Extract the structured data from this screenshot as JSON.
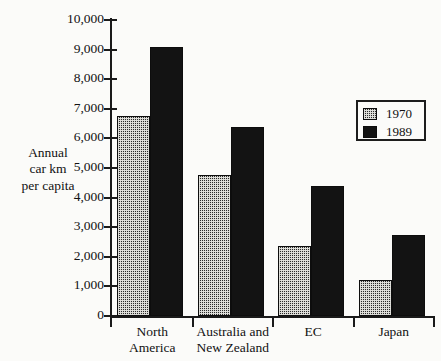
{
  "chart_data": {
    "type": "bar",
    "title": "",
    "xlabel": "",
    "ylabel": "Annual car km per capita",
    "ylabel_lines": [
      "Annual",
      "car km",
      "per capita"
    ],
    "categories": [
      "North America",
      "Australia and New Zealand",
      "EC",
      "Japan"
    ],
    "category_lines": [
      [
        "North",
        "America"
      ],
      [
        "Australia and",
        "New Zealand"
      ],
      [
        "EC"
      ],
      [
        "Japan"
      ]
    ],
    "series": [
      {
        "name": "1970",
        "values": [
          6750,
          4750,
          2350,
          1200
        ],
        "pattern": "hatch"
      },
      {
        "name": "1989",
        "values": [
          9100,
          6400,
          4400,
          2750
        ],
        "pattern": "solid"
      }
    ],
    "ylim": [
      0,
      10000
    ],
    "ytick_values": [
      10000,
      9000,
      8000,
      7000,
      6000,
      5000,
      4000,
      3000,
      2000,
      1000,
      0
    ],
    "ytick_labels": [
      "10,000",
      "9,000",
      "8,000",
      "7,000",
      "6,000",
      "5,000",
      "4,000",
      "3,000",
      "2,000",
      "1,000",
      "0"
    ],
    "grid": false,
    "legend_position": "upper right",
    "legend_entries": [
      "1970",
      "1989"
    ]
  },
  "colors": {
    "background": "#fbfbf9",
    "ink": "#111111",
    "bar_solid": "#131313",
    "bar_hatch": "#2a2a2a"
  }
}
